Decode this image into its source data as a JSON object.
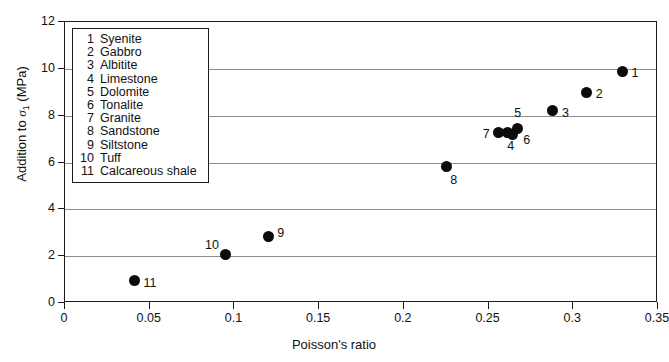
{
  "chart_data": {
    "type": "scatter",
    "title": "",
    "xlabel": "Poisson's ratio",
    "ylabel": "Addition to σ₁ (MPa)",
    "ylabel_prefix": "Addition to ",
    "ylabel_symbol": "σ",
    "ylabel_subscript": "1",
    "ylabel_suffix": " (MPa)",
    "xlim": [
      0,
      0.35
    ],
    "ylim": [
      0,
      12
    ],
    "xticks": [
      0,
      0.05,
      0.1,
      0.15,
      0.2,
      0.25,
      0.3,
      0.35
    ],
    "xtick_labels": [
      "0",
      "0.05",
      "0.1",
      "0.15",
      "0.2",
      "0.25",
      "0.3",
      "0.35"
    ],
    "yticks": [
      0,
      2,
      4,
      6,
      8,
      10,
      12
    ],
    "ytick_labels": [
      "0",
      "2",
      "4",
      "6",
      "8",
      "10",
      "12"
    ],
    "grid": "horizontal",
    "legend_position": "upper-left-inside",
    "marker_color": "#0b0b0b",
    "axis_color": "#1a1a1a",
    "grid_color": "#8d8d8d",
    "points": [
      {
        "id": "1",
        "name": "Syenite",
        "x": 0.329,
        "y": 9.9,
        "label_dx": 9,
        "label_dy": 2
      },
      {
        "id": "2",
        "name": "Gabbro",
        "x": 0.308,
        "y": 9.0,
        "label_dx": 9,
        "label_dy": 2
      },
      {
        "id": "3",
        "name": "Albitite",
        "x": 0.288,
        "y": 8.2,
        "label_dx": 9,
        "label_dy": 2
      },
      {
        "id": "4",
        "name": "Limestone",
        "x": 0.261,
        "y": 7.3,
        "label_dx": 0,
        "label_dy": 14
      },
      {
        "id": "5",
        "name": "Dolomite",
        "x": 0.267,
        "y": 7.45,
        "label_dx": -3,
        "label_dy": -16
      },
      {
        "id": "6",
        "name": "Tonalite",
        "x": 0.264,
        "y": 7.2,
        "label_dx": 11,
        "label_dy": 6
      },
      {
        "id": "7",
        "name": "Granite",
        "x": 0.256,
        "y": 7.3,
        "label_dx": -16,
        "label_dy": 2
      },
      {
        "id": "8",
        "name": "Sandstone",
        "x": 0.225,
        "y": 5.85,
        "label_dx": 4,
        "label_dy": 14
      },
      {
        "id": "9",
        "name": "Siltstone",
        "x": 0.12,
        "y": 2.82,
        "label_dx": 9,
        "label_dy": -4
      },
      {
        "id": "10",
        "name": "Tuff",
        "x": 0.095,
        "y": 2.09,
        "label_dx": -21,
        "label_dy": -9
      },
      {
        "id": "11",
        "name": "Calcareous shale",
        "x": 0.041,
        "y": 0.94,
        "label_dx": 9,
        "label_dy": 2
      }
    ]
  },
  "legend": {
    "entries": [
      {
        "num": "1",
        "label": "Syenite"
      },
      {
        "num": "2",
        "label": "Gabbro"
      },
      {
        "num": "3",
        "label": "Albitite"
      },
      {
        "num": "4",
        "label": "Limestone"
      },
      {
        "num": "5",
        "label": "Dolomite"
      },
      {
        "num": "6",
        "label": "Tonalite"
      },
      {
        "num": "7",
        "label": "Granite"
      },
      {
        "num": "8",
        "label": "Sandstone"
      },
      {
        "num": "9",
        "label": "Siltstone"
      },
      {
        "num": "10",
        "label": "Tuff"
      },
      {
        "num": "11",
        "label": "Calcareous shale"
      }
    ]
  }
}
